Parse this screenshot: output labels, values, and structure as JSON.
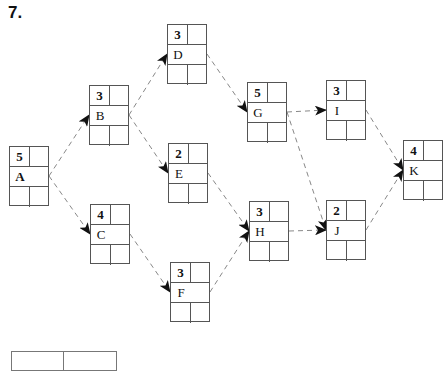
{
  "problem": {
    "number": "7."
  },
  "nodes": {
    "A": {
      "label": "A",
      "duration": "5",
      "x": 9,
      "y": 146
    },
    "B": {
      "label": "B",
      "duration": "3",
      "x": 89,
      "y": 85
    },
    "C": {
      "label": "C",
      "duration": "4",
      "x": 90,
      "y": 204
    },
    "D": {
      "label": "D",
      "duration": "3",
      "x": 167,
      "y": 24
    },
    "E": {
      "label": "E",
      "duration": "2",
      "x": 168,
      "y": 143
    },
    "F": {
      "label": "F",
      "duration": "3",
      "x": 170,
      "y": 262
    },
    "G": {
      "label": "G",
      "duration": "5",
      "x": 247,
      "y": 82
    },
    "H": {
      "label": "H",
      "duration": "3",
      "x": 249,
      "y": 201
    },
    "I": {
      "label": "I",
      "duration": "3",
      "x": 326,
      "y": 80
    },
    "J": {
      "label": "J",
      "duration": "2",
      "x": 326,
      "y": 200
    },
    "K": {
      "label": "K",
      "duration": "4",
      "x": 403,
      "y": 140
    }
  },
  "edges": [
    [
      "A",
      "B"
    ],
    [
      "A",
      "C"
    ],
    [
      "B",
      "D"
    ],
    [
      "B",
      "E"
    ],
    [
      "C",
      "F"
    ],
    [
      "D",
      "G"
    ],
    [
      "E",
      "H"
    ],
    [
      "F",
      "H"
    ],
    [
      "G",
      "I"
    ],
    [
      "G",
      "J"
    ],
    [
      "H",
      "J"
    ],
    [
      "I",
      "K"
    ],
    [
      "J",
      "K"
    ]
  ],
  "colors": {
    "line": "#555555",
    "edge": "#888888",
    "arrow": "#111111"
  }
}
